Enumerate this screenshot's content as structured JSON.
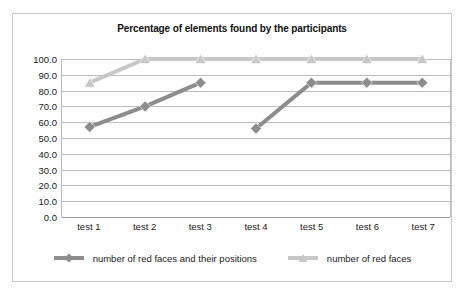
{
  "chart_data": {
    "type": "line",
    "title": "Percentage of elements found by the participants",
    "xlabel": "",
    "ylabel": "",
    "categories": [
      "test 1",
      "test 2",
      "test 3",
      "test 4",
      "test 5",
      "test 6",
      "test 7"
    ],
    "ylim": [
      0.0,
      100.0
    ],
    "ytick_labels": [
      "100.0",
      "90.0",
      "80.0",
      "70.0",
      "60.0",
      "50.0",
      "40.0",
      "30.0",
      "20.0",
      "10.0",
      "0.0"
    ],
    "ytick_values": [
      100.0,
      90.0,
      80.0,
      70.0,
      60.0,
      50.0,
      40.0,
      30.0,
      20.0,
      10.0,
      0.0
    ],
    "grid": "horizontal",
    "legend_position": "bottom",
    "series": [
      {
        "name": "number of red faces and their positions",
        "marker": "diamond",
        "color": "#8c8c8c",
        "values": [
          57,
          70,
          85,
          56,
          85,
          85,
          85
        ],
        "segments": [
          [
            0,
            1,
            2
          ],
          [
            3,
            4,
            5,
            6
          ]
        ]
      },
      {
        "name": "number of red faces",
        "marker": "triangle",
        "color": "#c7c7c7",
        "values": [
          85,
          100,
          100,
          100,
          100,
          100,
          100
        ],
        "segments": [
          [
            0,
            1,
            2,
            3,
            4,
            5,
            6
          ]
        ]
      }
    ]
  },
  "legend": {
    "items": [
      {
        "label": "number of red faces and their positions"
      },
      {
        "label": "number of red faces"
      }
    ]
  },
  "colors": {
    "series_dark": "#8c8c8c",
    "series_light": "#c7c7c7",
    "grid": "#bdbdbd",
    "border": "#c9c9c9",
    "text": "#1a1a1a"
  }
}
